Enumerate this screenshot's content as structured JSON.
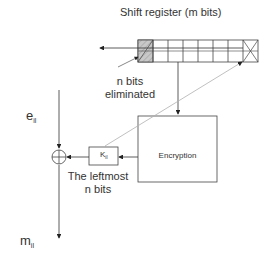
{
  "diagram": {
    "title": "Shift register (m bits)",
    "register": {
      "cell_count": 8,
      "first_cell": "hatched",
      "last_cell": "crossed"
    },
    "labels": {
      "eliminated_line1": "n bits",
      "eliminated_line2": "eliminated",
      "input_symbol": "e",
      "input_sub": "il",
      "output_symbol": "m",
      "output_sub": "il",
      "key_symbol": "K",
      "key_sub": "il",
      "encryption": "Encryption",
      "leftmost_line1": "The leftmost",
      "leftmost_line2": "n bits"
    },
    "colors": {
      "line": "#333333",
      "hatch_fill": "#c8c8c8",
      "feedback_line": "#b0b0b0"
    }
  }
}
